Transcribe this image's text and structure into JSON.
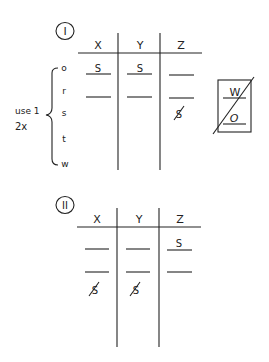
{
  "colors": {
    "ink": "#222222",
    "background": "#ffffff"
  },
  "part1": {
    "label": "I",
    "columns": [
      "X",
      "Y",
      "Z"
    ],
    "row_letters": [
      "o",
      "r",
      "s",
      "t",
      "w"
    ],
    "brace_note_line1": "use 1",
    "brace_note_line2": "2x",
    "slots": {
      "x1": "S",
      "y1": "S",
      "z1": "",
      "x2": "",
      "y2": "",
      "z2": ""
    },
    "struck_letter_z": "S",
    "box": {
      "top": "W",
      "bottom": "O",
      "crossed_out": true
    }
  },
  "part2": {
    "label": "II",
    "columns": [
      "X",
      "Y",
      "Z"
    ],
    "slots": {
      "x1": "",
      "y1": "",
      "z1": "S",
      "x2": "",
      "y2": "",
      "z2": ""
    },
    "struck_letter_x": "S",
    "struck_letter_y": "S"
  }
}
